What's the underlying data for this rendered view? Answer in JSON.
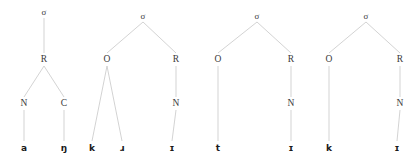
{
  "figure": {
    "background_color": "#ffffff",
    "branch_color": "#c8c8c8",
    "node_label_color": "#3a3a3a",
    "leaf_label_color": "#1b1b1b",
    "width": 417,
    "height": 165
  },
  "trees": [
    {
      "name": "tree-1",
      "nodes": [
        {
          "id": "t1-sigma",
          "label": "σ",
          "x": 44,
          "y": 12,
          "kind": "sigma"
        },
        {
          "id": "t1-r",
          "label": "R",
          "x": 44,
          "y": 60,
          "kind": "node"
        },
        {
          "id": "t1-n",
          "label": "N",
          "x": 24,
          "y": 104,
          "kind": "node"
        },
        {
          "id": "t1-c",
          "label": "C",
          "x": 64,
          "y": 104,
          "kind": "node"
        },
        {
          "id": "t1-l1",
          "label": "a",
          "x": 24,
          "y": 148,
          "kind": "leaf"
        },
        {
          "id": "t1-l2",
          "label": "ŋ",
          "x": 64,
          "y": 148,
          "kind": "leaf"
        }
      ],
      "edges": [
        {
          "from": "t1-sigma",
          "to": "t1-r"
        },
        {
          "from": "t1-r",
          "to": "t1-n"
        },
        {
          "from": "t1-r",
          "to": "t1-c"
        },
        {
          "from": "t1-n",
          "to": "t1-l1"
        },
        {
          "from": "t1-c",
          "to": "t1-l2"
        }
      ]
    },
    {
      "name": "tree-2",
      "nodes": [
        {
          "id": "t2-sigma",
          "label": "σ",
          "x": 143,
          "y": 16,
          "kind": "sigma"
        },
        {
          "id": "t2-o",
          "label": "O",
          "x": 107,
          "y": 60,
          "kind": "node"
        },
        {
          "id": "t2-r",
          "label": "R",
          "x": 176,
          "y": 60,
          "kind": "node"
        },
        {
          "id": "t2-n",
          "label": "N",
          "x": 176,
          "y": 104,
          "kind": "node"
        },
        {
          "id": "t2-l1",
          "label": "k",
          "x": 92,
          "y": 148,
          "kind": "leaf"
        },
        {
          "id": "t2-l2",
          "label": "ɹ",
          "x": 122,
          "y": 148,
          "kind": "leaf"
        },
        {
          "id": "t2-l3",
          "label": "ɪ",
          "x": 172,
          "y": 148,
          "kind": "leaf"
        }
      ],
      "edges": [
        {
          "from": "t2-sigma",
          "to": "t2-o"
        },
        {
          "from": "t2-sigma",
          "to": "t2-r"
        },
        {
          "from": "t2-o",
          "to": "t2-l1"
        },
        {
          "from": "t2-o",
          "to": "t2-l2"
        },
        {
          "from": "t2-r",
          "to": "t2-n"
        },
        {
          "from": "t2-n",
          "to": "t2-l3"
        }
      ]
    },
    {
      "name": "tree-3",
      "nodes": [
        {
          "id": "t3-sigma",
          "label": "σ",
          "x": 257,
          "y": 16,
          "kind": "sigma"
        },
        {
          "id": "t3-o",
          "label": "O",
          "x": 218,
          "y": 60,
          "kind": "node"
        },
        {
          "id": "t3-r",
          "label": "R",
          "x": 291,
          "y": 60,
          "kind": "node"
        },
        {
          "id": "t3-n",
          "label": "N",
          "x": 291,
          "y": 104,
          "kind": "node"
        },
        {
          "id": "t3-l1",
          "label": "t",
          "x": 218,
          "y": 148,
          "kind": "leaf"
        },
        {
          "id": "t3-l2",
          "label": "ɪ",
          "x": 291,
          "y": 148,
          "kind": "leaf"
        }
      ],
      "edges": [
        {
          "from": "t3-sigma",
          "to": "t3-o"
        },
        {
          "from": "t3-sigma",
          "to": "t3-r"
        },
        {
          "from": "t3-o",
          "to": "t3-l1"
        },
        {
          "from": "t3-r",
          "to": "t3-n"
        },
        {
          "from": "t3-n",
          "to": "t3-l2"
        }
      ]
    },
    {
      "name": "tree-4",
      "nodes": [
        {
          "id": "t4-sigma",
          "label": "σ",
          "x": 366,
          "y": 16,
          "kind": "sigma"
        },
        {
          "id": "t4-o",
          "label": "O",
          "x": 329,
          "y": 60,
          "kind": "node"
        },
        {
          "id": "t4-r",
          "label": "R",
          "x": 400,
          "y": 60,
          "kind": "node"
        },
        {
          "id": "t4-n",
          "label": "N",
          "x": 400,
          "y": 104,
          "kind": "node"
        },
        {
          "id": "t4-l1",
          "label": "k",
          "x": 329,
          "y": 148,
          "kind": "leaf"
        },
        {
          "id": "t4-l2",
          "label": "ɪ",
          "x": 397,
          "y": 148,
          "kind": "leaf"
        }
      ],
      "edges": [
        {
          "from": "t4-sigma",
          "to": "t4-o"
        },
        {
          "from": "t4-sigma",
          "to": "t4-r"
        },
        {
          "from": "t4-o",
          "to": "t4-l1"
        },
        {
          "from": "t4-r",
          "to": "t4-n"
        },
        {
          "from": "t4-n",
          "to": "t4-l2"
        }
      ]
    }
  ]
}
